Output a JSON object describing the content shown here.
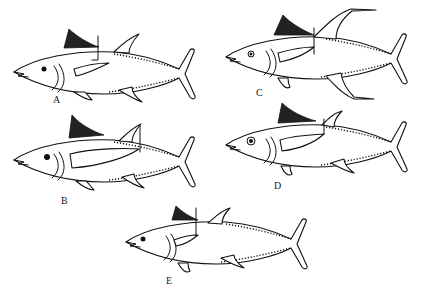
{
  "figure": {
    "type": "line-drawing",
    "panels": [
      {
        "id": "A",
        "label": "A",
        "variant": "short pectoral, long body"
      },
      {
        "id": "B",
        "label": "B",
        "variant": "long pectoral reaching beyond second dorsal"
      },
      {
        "id": "C",
        "label": "C",
        "variant": "very long second dorsal and anal fins"
      },
      {
        "id": "D",
        "label": "D",
        "variant": "large eye, moderate pectoral"
      },
      {
        "id": "E",
        "label": "E",
        "variant": "short pectoral, compact body"
      }
    ]
  },
  "colors": {
    "ink": "#111111",
    "background": "#ffffff"
  }
}
